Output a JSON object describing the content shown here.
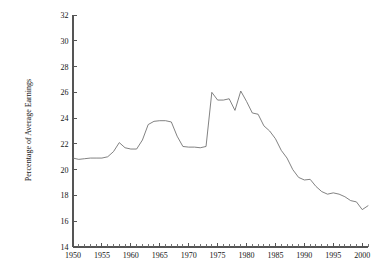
{
  "chart_data": {
    "type": "line",
    "title": "",
    "xlabel": "",
    "ylabel": "Percentage of Average Earnings",
    "xlim": [
      1950,
      2001
    ],
    "ylim": [
      14,
      32
    ],
    "grid": false,
    "legend": null,
    "x_tick_labels": [
      "1950",
      "1955",
      "1960",
      "1965",
      "1970",
      "1975",
      "1980",
      "1985",
      "1990",
      "1995",
      "2000"
    ],
    "x_tick_values": [
      1950,
      1955,
      1960,
      1965,
      1970,
      1975,
      1980,
      1985,
      1990,
      1995,
      2000
    ],
    "x_minor_tick_step": 1,
    "y_tick_labels": [
      "14",
      "16",
      "18",
      "20",
      "22",
      "24",
      "26",
      "28",
      "30",
      "32"
    ],
    "y_tick_values": [
      14,
      16,
      18,
      20,
      22,
      24,
      26,
      28,
      30,
      32
    ],
    "line_color": "#6b6b6b",
    "x": [
      1950,
      1951,
      1952,
      1953,
      1954,
      1955,
      1956,
      1957,
      1958,
      1959,
      1960,
      1961,
      1962,
      1963,
      1964,
      1965,
      1966,
      1967,
      1968,
      1969,
      1970,
      1971,
      1972,
      1973,
      1974,
      1975,
      1976,
      1977,
      1978,
      1979,
      1980,
      1981,
      1982,
      1983,
      1984,
      1985,
      1986,
      1987,
      1988,
      1989,
      1990,
      1991,
      1992,
      1993,
      1994,
      1995,
      1996,
      1997,
      1998,
      1999,
      2000,
      2001
    ],
    "values": [
      20.9,
      20.8,
      20.85,
      20.9,
      20.9,
      20.9,
      21.0,
      21.4,
      22.1,
      21.7,
      21.6,
      21.6,
      22.3,
      23.5,
      23.75,
      23.8,
      23.8,
      23.7,
      22.6,
      21.8,
      21.75,
      21.75,
      21.7,
      21.8,
      26.0,
      25.4,
      25.4,
      25.5,
      24.6,
      26.1,
      25.3,
      24.4,
      24.3,
      23.4,
      23.0,
      22.4,
      21.5,
      20.9,
      20.0,
      19.4,
      19.2,
      19.25,
      18.7,
      18.3,
      18.1,
      18.2,
      18.1,
      17.9,
      17.6,
      17.5,
      16.9,
      17.2
    ],
    "series": [
      {
        "name": "Percentage of Average Earnings",
        "values": [
          20.9,
          20.8,
          20.85,
          20.9,
          20.9,
          20.9,
          21.0,
          21.4,
          22.1,
          21.7,
          21.6,
          21.6,
          22.3,
          23.5,
          23.75,
          23.8,
          23.8,
          23.7,
          22.6,
          21.8,
          21.75,
          21.75,
          21.7,
          21.8,
          26.0,
          25.4,
          25.4,
          25.5,
          24.6,
          26.1,
          25.3,
          24.4,
          24.3,
          23.4,
          23.0,
          22.4,
          21.5,
          20.9,
          20.0,
          19.4,
          19.2,
          19.25,
          18.7,
          18.3,
          18.1,
          18.2,
          18.1,
          17.9,
          17.6,
          17.5,
          16.9,
          17.2
        ]
      }
    ]
  }
}
